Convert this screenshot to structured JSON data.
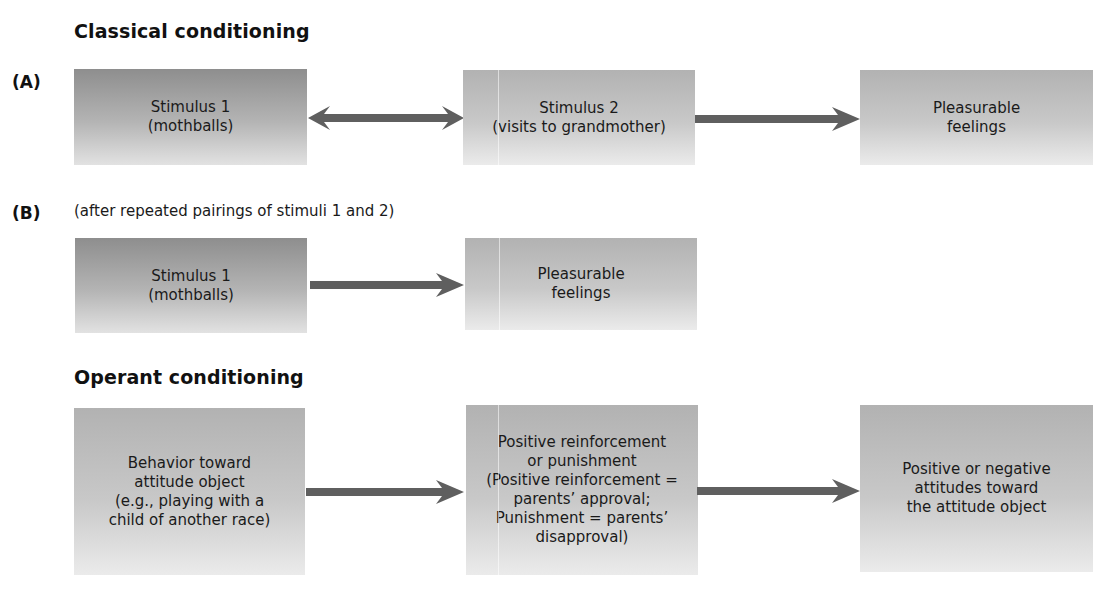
{
  "classical": {
    "title": "Classical conditioning",
    "panel_a": {
      "label": "(A)",
      "boxes": [
        {
          "text": "Stimulus 1\n(mothballs)"
        },
        {
          "text": "Stimulus 2\n(visits to grandmother)"
        },
        {
          "text": "Pleasurable\nfeelings"
        }
      ],
      "arrows": [
        {
          "type": "bidirectional",
          "from": "Stimulus 1",
          "to": "Stimulus 2"
        },
        {
          "type": "unidirectional",
          "from": "Stimulus 2",
          "to": "Pleasurable feelings"
        }
      ]
    },
    "panel_b": {
      "label": "(B)",
      "caption": "(after repeated pairings of stimuli 1 and 2)",
      "boxes": [
        {
          "text": "Stimulus 1\n(mothballs)"
        },
        {
          "text": "Pleasurable\nfeelings"
        }
      ],
      "arrows": [
        {
          "type": "unidirectional",
          "from": "Stimulus 1",
          "to": "Pleasurable feelings"
        }
      ]
    }
  },
  "operant": {
    "title": "Operant conditioning",
    "boxes": [
      {
        "text": "Behavior toward\nattitude object\n(e.g., playing with a\nchild of another race)"
      },
      {
        "text": "Positive reinforcement\nor punishment\n(Positive reinforcement =\nparents’ approval;\nPunishment = parents’\ndisapproval)"
      },
      {
        "text": "Positive or negative\nattitudes toward\nthe attitude object"
      }
    ],
    "arrows": [
      {
        "type": "unidirectional",
        "from": "Behavior",
        "to": "Reinforcement/punishment"
      },
      {
        "type": "unidirectional",
        "from": "Reinforcement/punishment",
        "to": "Attitudes"
      }
    ]
  },
  "colors": {
    "arrow": "#5f5f5f",
    "box_dark_top": "#8e8e8e",
    "box_light_top": "#b2b2b2",
    "box_bottom": "#e6e6e6",
    "text": "#1a1a1a"
  }
}
